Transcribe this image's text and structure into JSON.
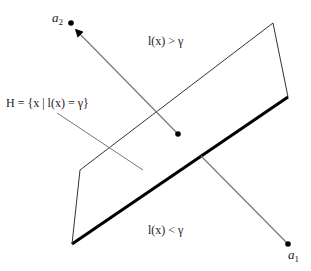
{
  "figure": {
    "type": "hyperplane-decision-diagram",
    "labels": {
      "a2": {
        "base": "a",
        "sub": "2"
      },
      "a1": {
        "base": "a",
        "sub": "1"
      },
      "upper_region": "l(x) > γ",
      "lower_region": "l(x) < γ",
      "hyperplane": "H = {x | l(x) = γ}"
    },
    "colors": {
      "plane_edge": "#333333",
      "plane_bold_edge": "#000000",
      "vector": "#777777",
      "point": "#000000",
      "text": "#222222"
    },
    "points": {
      "a2": [
        71,
        23
      ],
      "a1": [
        288,
        244
      ],
      "plane_center": [
        178,
        134
      ]
    },
    "plane": {
      "corners": [
        [
          80,
          170
        ],
        [
          273,
          23
        ],
        [
          288,
          97
        ],
        [
          72,
          244
        ]
      ]
    }
  }
}
